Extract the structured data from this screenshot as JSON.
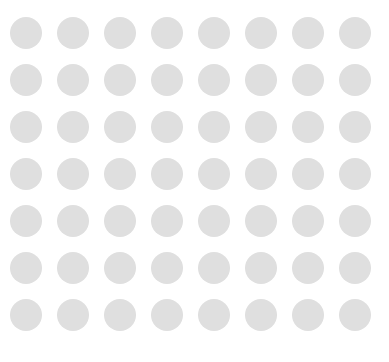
{
  "canvas": {
    "name": "circle-grid",
    "width": 389,
    "height": 362,
    "background_color": "#ffffff"
  },
  "grid": {
    "columns": 8,
    "rows": 7,
    "total_circles": 56,
    "circle_diameter": 32,
    "column_pitch": 47,
    "row_pitch": 47,
    "origin_x": 10,
    "origin_y": 17,
    "circle_color": "#dfdfdf",
    "circle_shape": "circle",
    "uniform": true
  },
  "column_positions": [
    10,
    57,
    104,
    151,
    198,
    245,
    292,
    339
  ],
  "row_positions": [
    17,
    64,
    111,
    158,
    205,
    252,
    299
  ]
}
